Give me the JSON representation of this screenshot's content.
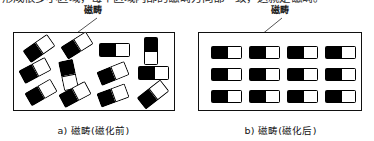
{
  "top_text": {
    "clipped_line": "形成很多小区域，每个区域内部的磁畴方向都一致，这就是磁畴。",
    "note": "bottom edge of a text line clipped by the top of the screenshot"
  },
  "figure": {
    "panels": [
      {
        "id": "before",
        "callout_label": "磁畴",
        "caption": "a) 磁畴(磁化前)",
        "leader_line": {
          "x1": 97,
          "y1": 18,
          "x2": 62,
          "y2": 44
        },
        "box": {
          "x": 13,
          "y": 32,
          "width": 162,
          "height": 79
        },
        "domains": [
          {
            "x": 10,
            "y": 8,
            "w": 30,
            "h": 15,
            "rotate": -35
          },
          {
            "x": 6,
            "y": 30,
            "w": 30,
            "h": 15,
            "rotate": -28
          },
          {
            "x": 12,
            "y": 52,
            "w": 30,
            "h": 15,
            "rotate": -30
          },
          {
            "x": 48,
            "y": 5,
            "w": 30,
            "h": 15,
            "rotate": -32
          },
          {
            "x": 47,
            "y": 27,
            "w": 15,
            "h": 30,
            "rotate": -12
          },
          {
            "x": 46,
            "y": 54,
            "w": 30,
            "h": 15,
            "rotate": -28
          },
          {
            "x": 85,
            "y": 10,
            "w": 31,
            "h": 14,
            "rotate": 0
          },
          {
            "x": 84,
            "y": 33,
            "w": 30,
            "h": 15,
            "rotate": -22
          },
          {
            "x": 84,
            "y": 55,
            "w": 30,
            "h": 15,
            "rotate": -20
          },
          {
            "x": 130,
            "y": 4,
            "w": 14,
            "h": 28,
            "rotate": 0
          },
          {
            "x": 124,
            "y": 33,
            "w": 31,
            "h": 14,
            "rotate": 0
          },
          {
            "x": 124,
            "y": 54,
            "w": 30,
            "h": 15,
            "rotate": -38
          }
        ]
      },
      {
        "id": "after",
        "callout_label": "磁畴",
        "caption": "b) 磁畴(磁化后)",
        "leader_line": {
          "x1": 95,
          "y1": 18,
          "x2": 63,
          "y2": 44
        },
        "box": {
          "x": 11,
          "y": 32,
          "width": 164,
          "height": 79
        },
        "grid": {
          "columns": 4,
          "rows": 3
        },
        "domains": [
          {
            "x": 12,
            "y": 13,
            "w": 31,
            "h": 13,
            "rotate": 0
          },
          {
            "x": 50,
            "y": 13,
            "w": 31,
            "h": 13,
            "rotate": 0
          },
          {
            "x": 88,
            "y": 13,
            "w": 31,
            "h": 13,
            "rotate": 0
          },
          {
            "x": 126,
            "y": 13,
            "w": 31,
            "h": 13,
            "rotate": 0
          },
          {
            "x": 12,
            "y": 35,
            "w": 31,
            "h": 13,
            "rotate": 0
          },
          {
            "x": 50,
            "y": 35,
            "w": 31,
            "h": 13,
            "rotate": 0
          },
          {
            "x": 88,
            "y": 35,
            "w": 31,
            "h": 13,
            "rotate": 0
          },
          {
            "x": 126,
            "y": 35,
            "w": 31,
            "h": 13,
            "rotate": 0
          },
          {
            "x": 12,
            "y": 57,
            "w": 31,
            "h": 13,
            "rotate": 0
          },
          {
            "x": 50,
            "y": 57,
            "w": 31,
            "h": 13,
            "rotate": 0
          },
          {
            "x": 88,
            "y": 57,
            "w": 31,
            "h": 13,
            "rotate": 0
          },
          {
            "x": 126,
            "y": 57,
            "w": 31,
            "h": 13,
            "rotate": 0
          }
        ]
      }
    ]
  },
  "colors": {
    "domain_dark": "#000000",
    "domain_light": "#ffffff",
    "outline": "#000000",
    "box_border": "#111111",
    "leader_line": "#555555",
    "page_background": "#ffffff"
  }
}
